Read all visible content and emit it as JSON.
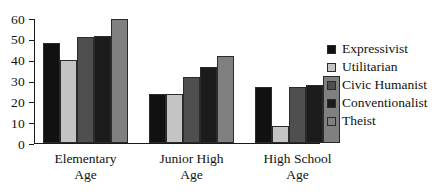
{
  "chart_data": {
    "type": "bar",
    "title": "",
    "xlabel": "",
    "ylabel": "",
    "ylim": [
      0,
      60
    ],
    "yticks": [
      0,
      10,
      20,
      30,
      40,
      50,
      60
    ],
    "grid": false,
    "legend_position": "right",
    "categories": [
      "Elementary Age",
      "Junior High Age",
      "High School Age"
    ],
    "category_lines": [
      [
        "Elementary",
        "Age"
      ],
      [
        "Junior High",
        "Age"
      ],
      [
        "High School",
        "Age"
      ]
    ],
    "series": [
      {
        "name": "Expressivist",
        "color": "#111111",
        "values": [
          48,
          23.5,
          27
        ]
      },
      {
        "name": "Utilitarian",
        "color": "#c4c4c4",
        "values": [
          40,
          23.5,
          8
        ]
      },
      {
        "name": "Civic Humanist",
        "color": "#4f4f4f",
        "values": [
          51,
          31.5,
          27
        ]
      },
      {
        "name": "Conventionalist",
        "color": "#1c1c1c",
        "values": [
          51.5,
          36.5,
          28
        ]
      },
      {
        "name": "Theist",
        "color": "#808080",
        "values": [
          59.5,
          42,
          32
        ]
      }
    ]
  },
  "axis": {
    "y_tick_labels": [
      "60",
      "50",
      "40",
      "30",
      "20",
      "10",
      "0"
    ]
  },
  "legend": {
    "items": [
      {
        "label": "Expressivist",
        "color": "#111111",
        "swatch_name": "legend-swatch-expressivist"
      },
      {
        "label": "Utilitarian",
        "color": "#c4c4c4",
        "swatch_name": "legend-swatch-utilitarian"
      },
      {
        "label": "Civic Humanist",
        "color": "#4f4f4f",
        "swatch_name": "legend-swatch-civic-humanist"
      },
      {
        "label": "Conventionalist",
        "color": "#1c1c1c",
        "swatch_name": "legend-swatch-conventionalist"
      },
      {
        "label": "Theist",
        "color": "#808080",
        "swatch_name": "legend-swatch-theist"
      }
    ]
  }
}
